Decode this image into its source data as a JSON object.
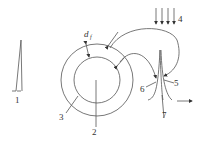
{
  "diagram": {
    "type": "technical schematic",
    "labels": {
      "n1": "1",
      "n2": "2",
      "n3": "3",
      "n4": "4",
      "n5": "5",
      "n6": "6",
      "n7": "7",
      "d": "d",
      "d_sub": "f"
    },
    "colors": {
      "line": "#555555",
      "text": "#333333",
      "background": "#ffffff"
    },
    "elements": [
      {
        "id": "1",
        "desc": "narrow spike / peak profile"
      },
      {
        "id": "2",
        "desc": "inner circle core"
      },
      {
        "id": "3",
        "desc": "outer ring / annulus"
      },
      {
        "id": "4",
        "desc": "downward parallel arrows (4)"
      },
      {
        "id": "5",
        "desc": "right side of sharp peak"
      },
      {
        "id": "6",
        "desc": "left side of sharp peak"
      },
      {
        "id": "7",
        "desc": "peak stem"
      },
      {
        "id": "d_f",
        "desc": "ring thickness dimension"
      }
    ]
  }
}
